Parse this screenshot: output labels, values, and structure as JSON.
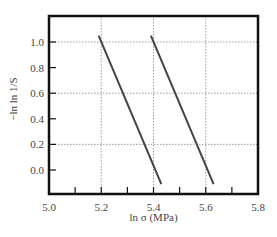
{
  "chart_data": {
    "type": "line",
    "title": "",
    "xlabel": "ln σ (MPa)",
    "ylabel": "−ln ln 1/S",
    "xlim": [
      5.0,
      5.8
    ],
    "ylim": [
      -0.15,
      1.2
    ],
    "x_ticks": [
      "5.0",
      "5.2",
      "5.4",
      "5.6",
      "5.8"
    ],
    "x_tick_values": [
      5.0,
      5.2,
      5.4,
      5.6,
      5.8
    ],
    "x_minor_ticks": [
      5.1,
      5.3,
      5.5,
      5.7
    ],
    "y_ticks": [
      "0.0",
      "0.2",
      "0.4",
      "0.6",
      "0.8",
      "1.0"
    ],
    "y_tick_values": [
      0.0,
      0.2,
      0.4,
      0.6,
      0.8,
      1.0
    ],
    "grid": {
      "x": [
        5.2,
        5.4,
        5.6
      ],
      "y": [
        0.2,
        0.6,
        1.0
      ],
      "style": "dotted"
    },
    "legend": null,
    "series": [
      {
        "name": "line-1",
        "x": [
          5.19,
          5.43
        ],
        "y": [
          1.05,
          -0.11
        ]
      },
      {
        "name": "line-2",
        "x": [
          5.39,
          5.63
        ],
        "y": [
          1.05,
          -0.11
        ]
      }
    ],
    "colors": {
      "line": "#444444",
      "frame": "#111111",
      "grid": "#888888",
      "text": "#444444"
    }
  }
}
